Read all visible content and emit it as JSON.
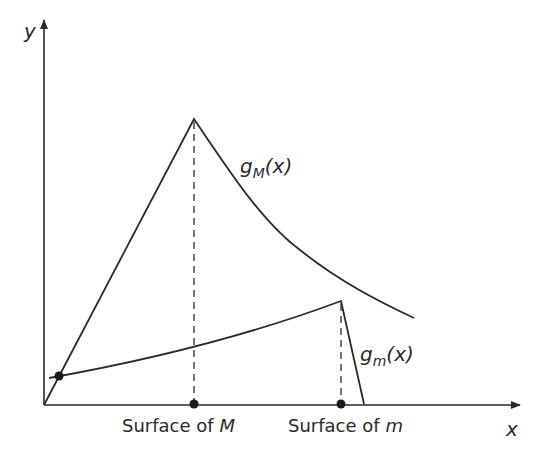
{
  "diagram": {
    "axes": {
      "x_label": "x",
      "y_label": "y"
    },
    "curves": [
      {
        "name": "g_M",
        "label_main": "g",
        "label_sub": "M",
        "label_arg": "(x)"
      },
      {
        "name": "g_m",
        "label_main": "g",
        "label_sub": "m",
        "label_arg": "(x)"
      }
    ],
    "markers": [
      {
        "label_prefix": "Surface of ",
        "label_var": "M"
      },
      {
        "label_prefix": "Surface of ",
        "label_var": "m"
      }
    ],
    "colors": {
      "line": "#2a2a2a",
      "background": "#ffffff"
    }
  }
}
